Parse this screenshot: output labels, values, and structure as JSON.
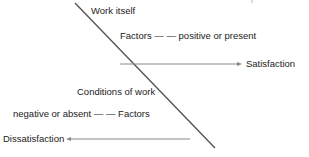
{
  "diagram": {
    "labels": {
      "work_itself": "Work itself",
      "factors_positive": "Factors — — positive or present",
      "satisfaction": "Satisfaction",
      "conditions_of_work": "Conditions of work",
      "factors_negative": "negative or absent — — Factors",
      "dissatisfaction": "Dissatisfaction"
    },
    "colors": {
      "line": "#555555",
      "arrow": "#888888",
      "text": "#222222"
    }
  }
}
